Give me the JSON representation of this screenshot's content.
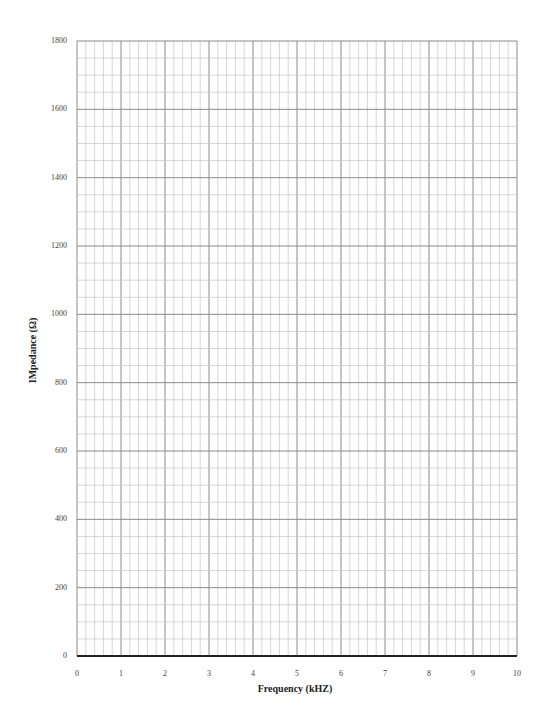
{
  "chart_data": {
    "type": "line",
    "title": "",
    "xlabel": "Frequency (kHZ)",
    "ylabel": "IMpedance (Ω)",
    "xlim": [
      0,
      10
    ],
    "ylim": [
      0,
      1800
    ],
    "x_ticks": [
      "0",
      "1",
      "2",
      "3",
      "4",
      "5",
      "6",
      "7",
      "8",
      "9",
      "10"
    ],
    "y_ticks": [
      "0",
      "200",
      "400",
      "600",
      "800",
      "1000",
      "1200",
      "1400",
      "1600",
      "1800"
    ],
    "x_minor_divisions": 5,
    "y_minor_divisions": 4,
    "grid": true,
    "series": [],
    "note": "Blank graph paper with no plotted data"
  },
  "colors": {
    "major_grid": "#8a8a8a",
    "minor_grid": "#c4c4c4",
    "axis": "#222222"
  }
}
